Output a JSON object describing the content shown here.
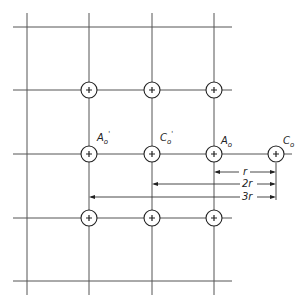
{
  "diagram": {
    "grid": {
      "vertical_x": [
        27,
        89,
        152,
        214
      ],
      "horizontal_y": [
        27,
        90,
        154,
        218,
        281
      ]
    },
    "labels": {
      "a0_prime": "A",
      "a0_prime_sub": "o",
      "a0_prime_mark": "'",
      "c0_prime": "C",
      "c0_prime_sub": "o",
      "c0_prime_mark": "'",
      "a0": "A",
      "a0_sub": "o",
      "c0": "C",
      "c0_sub": "o"
    },
    "dimensions": {
      "r": "r",
      "two_r": "2r",
      "three_r": "3r"
    },
    "colors": {
      "line": "#555555",
      "ink": "#222222"
    }
  }
}
